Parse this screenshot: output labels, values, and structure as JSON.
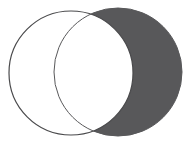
{
  "figure": {
    "kind": "venn-diagram",
    "width": 190,
    "height": 150,
    "background_color": "#ffffff"
  },
  "colors": {
    "background": "#ffffff",
    "shaded_fill": "#58585a",
    "unshaded_fill": "#ffffff",
    "outline_stroke": "#4a4a4c",
    "shaded_outline_stroke": "#58585a"
  },
  "geometry": {
    "left_circle": {
      "cx": 71,
      "cy": 73,
      "r": 62,
      "stroke_width": 1.2
    },
    "right_circle": {
      "cx": 118,
      "cy": 72,
      "r": 64,
      "stroke_width": 1.0
    },
    "intersection_points": [
      {
        "x": 96,
        "y": 11
      },
      {
        "x": 95,
        "y": 139
      }
    ]
  },
  "regions": [
    {
      "id": "left-only",
      "label": "left circle only",
      "fill": "#ffffff",
      "shaded": false
    },
    {
      "id": "intersection",
      "label": "intersection lens",
      "fill": "#ffffff",
      "shaded": false
    },
    {
      "id": "right-only",
      "label": "right circle only",
      "fill": "#58585a",
      "shaded": true
    }
  ]
}
